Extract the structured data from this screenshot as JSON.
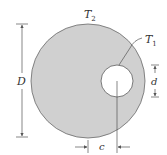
{
  "diagram": {
    "outer_circle": {
      "cx": 88,
      "cy": 81,
      "r": 57,
      "fill": "#d0d0d0",
      "stroke": "#6a6a6a"
    },
    "inner_hole": {
      "cx": 117,
      "cy": 81,
      "r": 16,
      "fill": "#ffffff",
      "stroke": "#5a5a5a"
    },
    "labels": {
      "outer_temp": {
        "main": "T",
        "sub": "2"
      },
      "inner_temp": {
        "main": "T",
        "sub": "1"
      },
      "outer_diameter": "D",
      "inner_diameter": "d",
      "eccentricity": "c"
    }
  }
}
